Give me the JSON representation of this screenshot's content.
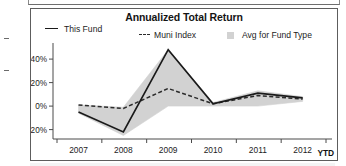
{
  "chart_title": "Annualized Total Return",
  "ytd_label": "YTD",
  "legend": [
    {
      "label": "This Fund",
      "marker": "solid-line",
      "color": "#1a1a1a"
    },
    {
      "label": "Muni Index",
      "marker": "dashed-line",
      "color": "#2b2b2b"
    },
    {
      "label": "Avg for Fund Type",
      "marker": "filled-square",
      "color": "#d2d2d2"
    }
  ],
  "chart_data": {
    "type": "line",
    "title": "Annualized Total Return",
    "xlabel": "",
    "ylabel": "",
    "categories": [
      "2007",
      "2008",
      "2009",
      "2010",
      "2011",
      "2012"
    ],
    "x_tick_labels": [
      "2007",
      "2008",
      "2009",
      "2010",
      "2011",
      "2012"
    ],
    "y_tick_labels": [
      "40%",
      "20%",
      "0%",
      "-20%"
    ],
    "y_tick_values": [
      40,
      20,
      0,
      -20
    ],
    "ylim": [
      -28,
      52
    ],
    "grid": false,
    "legend_position": "top",
    "annotations": [
      "YTD"
    ],
    "series": [
      {
        "name": "This Fund",
        "style": "solid",
        "color": "#1a1a1a",
        "values": [
          -5,
          -22,
          48,
          2,
          11,
          7
        ]
      },
      {
        "name": "Muni Index",
        "style": "dashed",
        "color": "#2b2b2b",
        "values": [
          1,
          -2,
          15,
          2,
          9,
          6
        ]
      },
      {
        "name": "Avg for Fund Type",
        "style": "band",
        "color": "#d2d2d2",
        "upper": [
          1,
          -1,
          48,
          3,
          13,
          8
        ],
        "lower": [
          -6,
          -25,
          0,
          0,
          0,
          4
        ]
      }
    ]
  }
}
